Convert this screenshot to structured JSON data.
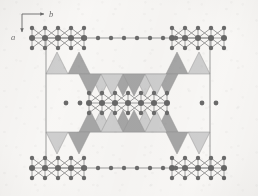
{
  "figure": {
    "kind": "crystal-structure-projection",
    "width": 258,
    "height": 196,
    "background_color": "#f4f2ef"
  },
  "axes": {
    "horizontal": {
      "label": "b",
      "direction": "right"
    },
    "vertical": {
      "label": "a",
      "direction": "down"
    },
    "origin": {
      "x": 22,
      "y": 14
    },
    "arrow_color": "#222222"
  },
  "unit_cell": {
    "left": 46,
    "right": 210,
    "top": 38,
    "bottom": 168,
    "line_color": "#555555",
    "line_width": 0.9
  },
  "colors": {
    "atom_large": "#141414",
    "atom_small": "#1a1a1a",
    "bond": "#3a3a3a",
    "triangle_light": "#b4b4b4",
    "triangle_dark": "#767676",
    "triangle_edge": "#5a5a5a",
    "cell_line": "#555555",
    "paper": "#f4f2ef"
  },
  "geometry": {
    "triangle_half_width": 11,
    "triangle_height": 22,
    "atom_radius_large": 3.0,
    "atom_radius_small": 2.2
  },
  "chart_data": {
    "type": "scatter",
    "title": "",
    "xlabel": "b",
    "ylabel": "a",
    "grid": false,
    "legend": null,
    "atom_clusters": [
      {
        "name": "cluster-top-left",
        "center": {
          "x": 58,
          "y": 38
        },
        "rows": [
          {
            "dy": -10,
            "xs": [
              -26,
              -13,
              0,
              13,
              26
            ],
            "r": 2.2
          },
          {
            "dy": 0,
            "xs": [
              -26,
              -13,
              0,
              13,
              26
            ],
            "r": 3.0
          },
          {
            "dy": 10,
            "xs": [
              -26,
              -13,
              0,
              13,
              26
            ],
            "r": 2.2
          }
        ]
      },
      {
        "name": "cluster-top-right",
        "center": {
          "x": 198,
          "y": 38
        },
        "rows": [
          {
            "dy": -10,
            "xs": [
              -26,
              -13,
              0,
              13,
              26
            ],
            "r": 2.2
          },
          {
            "dy": 0,
            "xs": [
              -26,
              -13,
              0,
              13,
              26
            ],
            "r": 3.0
          },
          {
            "dy": 10,
            "xs": [
              -26,
              -13,
              0,
              13,
              26
            ],
            "r": 2.2
          }
        ]
      },
      {
        "name": "cluster-bottom-left",
        "center": {
          "x": 58,
          "y": 168
        },
        "rows": [
          {
            "dy": -10,
            "xs": [
              -26,
              -13,
              0,
              13,
              26
            ],
            "r": 2.2
          },
          {
            "dy": 0,
            "xs": [
              -26,
              -13,
              0,
              13,
              26
            ],
            "r": 3.0
          },
          {
            "dy": 10,
            "xs": [
              -26,
              -13,
              0,
              13,
              26
            ],
            "r": 2.2
          }
        ]
      },
      {
        "name": "cluster-bottom-right",
        "center": {
          "x": 198,
          "y": 168
        },
        "rows": [
          {
            "dy": -10,
            "xs": [
              -26,
              -13,
              0,
              13,
              26
            ],
            "r": 2.2
          },
          {
            "dy": 0,
            "xs": [
              -26,
              -13,
              0,
              13,
              26
            ],
            "r": 3.0
          },
          {
            "dy": 10,
            "xs": [
              -26,
              -13,
              0,
              13,
              26
            ],
            "r": 2.2
          }
        ]
      },
      {
        "name": "cluster-center",
        "center": {
          "x": 128,
          "y": 103
        },
        "rows": [
          {
            "dy": -10,
            "xs": [
              -39,
              -26,
              -13,
              0,
              13,
              26,
              39
            ],
            "r": 2.2
          },
          {
            "dy": 0,
            "xs": [
              -39,
              -26,
              -13,
              0,
              13,
              26,
              39
            ],
            "r": 3.0
          },
          {
            "dy": 10,
            "xs": [
              -39,
              -26,
              -13,
              0,
              13,
              26,
              39
            ],
            "r": 2.2
          }
        ]
      }
    ],
    "edge_atom_rows": [
      {
        "name": "top-cell-edge-atoms",
        "y": 38,
        "xs": [
          85,
          98,
          111,
          124,
          137,
          150,
          163,
          176
        ],
        "r": 2.2
      },
      {
        "name": "bottom-cell-edge-atoms",
        "y": 168,
        "xs": [
          85,
          98,
          111,
          124,
          137,
          150,
          163,
          176
        ],
        "r": 2.2
      }
    ],
    "isolated_atoms": [
      {
        "name": "isolated-left-1",
        "x": 66,
        "y": 103,
        "r": 2.4
      },
      {
        "name": "isolated-left-2",
        "x": 80,
        "y": 103,
        "r": 2.4
      },
      {
        "name": "isolated-right-1",
        "x": 202,
        "y": 103,
        "r": 2.4
      },
      {
        "name": "isolated-right-2",
        "x": 216,
        "y": 103,
        "r": 2.4
      }
    ],
    "triangle_bands": [
      {
        "name": "band-upper-outer",
        "baseline_y": 74,
        "apex_y": 52,
        "orientation": "up",
        "triangles": [
          {
            "cx": 57,
            "shade": "light"
          },
          {
            "cx": 79,
            "shade": "dark"
          },
          {
            "cx": 199,
            "shade": "light"
          },
          {
            "cx": 177,
            "shade": "dark"
          }
        ]
      },
      {
        "name": "band-upper-inner",
        "baseline_y": 74,
        "apex_y": 96,
        "orientation": "down",
        "triangles": [
          {
            "cx": 101,
            "shade": "light"
          },
          {
            "cx": 123,
            "shade": "dark"
          },
          {
            "cx": 145,
            "shade": "light"
          },
          {
            "cx": 167,
            "shade": "dark"
          },
          {
            "cx": 90,
            "shade": "dark"
          },
          {
            "cx": 112,
            "shade": "light"
          },
          {
            "cx": 134,
            "shade": "dark"
          },
          {
            "cx": 156,
            "shade": "light"
          }
        ]
      },
      {
        "name": "band-lower-inner",
        "baseline_y": 132,
        "apex_y": 110,
        "orientation": "up",
        "triangles": [
          {
            "cx": 101,
            "shade": "light"
          },
          {
            "cx": 123,
            "shade": "dark"
          },
          {
            "cx": 145,
            "shade": "light"
          },
          {
            "cx": 167,
            "shade": "dark"
          },
          {
            "cx": 90,
            "shade": "dark"
          },
          {
            "cx": 112,
            "shade": "light"
          },
          {
            "cx": 134,
            "shade": "dark"
          },
          {
            "cx": 156,
            "shade": "light"
          }
        ]
      },
      {
        "name": "band-lower-outer",
        "baseline_y": 132,
        "apex_y": 154,
        "orientation": "down",
        "triangles": [
          {
            "cx": 57,
            "shade": "light"
          },
          {
            "cx": 79,
            "shade": "dark"
          },
          {
            "cx": 199,
            "shade": "light"
          },
          {
            "cx": 177,
            "shade": "dark"
          }
        ]
      }
    ]
  }
}
